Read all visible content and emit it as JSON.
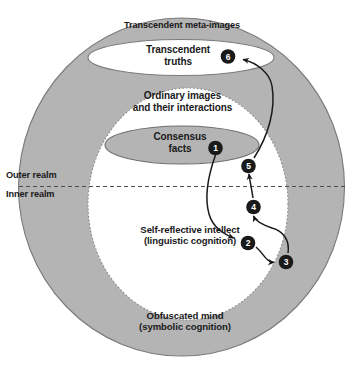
{
  "diagram": {
    "title": "Transcendent meta-images",
    "regions": {
      "outer_ring_label": "Transcendent meta-images",
      "transcendent_truths": "Transcendent\ntruths",
      "ordinary_images": "Ordinary images\nand their interactions",
      "consensus_facts": "Consensus\nfacts",
      "self_reflective": "Self-reflective intellect\n(linguistic cognition)",
      "obfuscated_mind": "Obfuscated mind\n(symbolic cognition)"
    },
    "realms": {
      "outer": "Outer realm",
      "inner": "Inner realm"
    },
    "markers": [
      {
        "id": "1",
        "label": "1"
      },
      {
        "id": "2",
        "label": "2"
      },
      {
        "id": "3",
        "label": "3"
      },
      {
        "id": "4",
        "label": "4"
      },
      {
        "id": "5",
        "label": "5"
      },
      {
        "id": "6",
        "label": "6"
      }
    ],
    "colors": {
      "fill_gray": "#b3b3b3",
      "stroke_gray": "#808080",
      "white": "#ffffff",
      "text": "#1a1a1a",
      "marker_fill": "#1a1a1a",
      "marker_text": "#ffffff",
      "arrow": "#1a1a1a"
    }
  }
}
